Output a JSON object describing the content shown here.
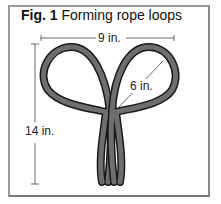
{
  "figure": {
    "number_label": "Fig. 1",
    "title": "Forming rope loops"
  },
  "dimensions": {
    "width_label": "9 in.",
    "height_label": "14 in.",
    "loop_label": "6 in."
  },
  "colors": {
    "rope_fill": "#6e6e6e",
    "rope_outline": "#1a1a1a",
    "frame": "#9a9a9a"
  }
}
